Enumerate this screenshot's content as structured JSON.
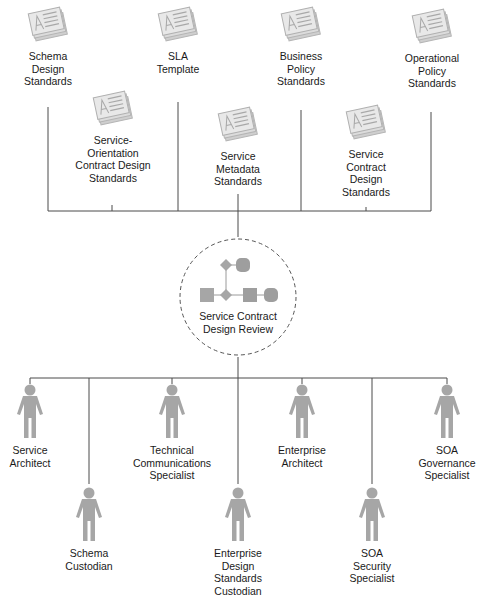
{
  "diagram": {
    "title": "Service Contract Design Review",
    "center": {
      "label": "Service Contract\nDesign Review",
      "icon": "process-flow-icon",
      "border_style": "dashed-circle"
    },
    "documents": [
      {
        "id": "schema-design-standards",
        "label": "Schema\nDesign\nStandards",
        "icon": "document-stack-icon"
      },
      {
        "id": "sla-template",
        "label": "SLA\nTemplate",
        "icon": "document-stack-icon"
      },
      {
        "id": "business-policy-standards",
        "label": "Business\nPolicy\nStandards",
        "icon": "document-stack-icon"
      },
      {
        "id": "operational-policy-standards",
        "label": "Operational\nPolicy\nStandards",
        "icon": "document-stack-icon"
      },
      {
        "id": "service-orientation-contract-design-standards",
        "label": "Service-\nOrientation\nContract Design\nStandards",
        "icon": "document-stack-icon"
      },
      {
        "id": "service-metadata-standards",
        "label": "Service\nMetadata\nStandards",
        "icon": "document-stack-icon"
      },
      {
        "id": "service-contract-design-standards",
        "label": "Service\nContract\nDesign\nStandards",
        "icon": "document-stack-icon"
      }
    ],
    "roles": [
      {
        "id": "service-architect",
        "label": "Service\nArchitect",
        "icon": "person-icon"
      },
      {
        "id": "schema-custodian",
        "label": "Schema\nCustodian",
        "icon": "person-icon"
      },
      {
        "id": "technical-communications-specialist",
        "label": "Technical\nCommunications\nSpecialist",
        "icon": "person-icon"
      },
      {
        "id": "enterprise-design-standards-custodian",
        "label": "Enterprise\nDesign\nStandards\nCustodian",
        "icon": "person-icon"
      },
      {
        "id": "enterprise-architect",
        "label": "Enterprise\nArchitect",
        "icon": "person-icon"
      },
      {
        "id": "soa-security-specialist",
        "label": "SOA\nSecurity\nSpecialist",
        "icon": "person-icon"
      },
      {
        "id": "soa-governance-specialist",
        "label": "SOA\nGovernance\nSpecialist",
        "icon": "person-icon"
      }
    ],
    "colors": {
      "line": "#4a4a4a",
      "icon_fill": "#a6a6a6",
      "doc_fill": "#d9d9d9",
      "text": "#1a1a1a"
    }
  }
}
